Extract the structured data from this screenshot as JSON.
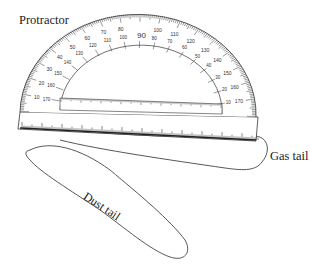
{
  "diagram": {
    "labels": {
      "protractor": "Protractor",
      "gas_tail": "Gas tail",
      "dust_tail": "Dust tail"
    },
    "protractor": {
      "outer_scale": [
        "10",
        "20",
        "30",
        "40",
        "50",
        "60",
        "70",
        "80",
        "90",
        "100",
        "110",
        "120",
        "130",
        "140",
        "150",
        "160",
        "170"
      ],
      "inner_scale": [
        "170",
        "160",
        "150",
        "140",
        "130",
        "120",
        "110",
        "100",
        "90",
        "80",
        "70",
        "60",
        "50",
        "40",
        "30",
        "20",
        "10"
      ],
      "center_mark": "90"
    },
    "colors": {
      "ink": "#333333",
      "background": "#ffffff"
    }
  }
}
